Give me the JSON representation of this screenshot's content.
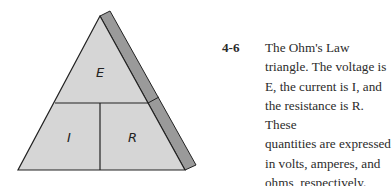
{
  "figure": {
    "type": "ohms-law-triangle",
    "labels": {
      "top": "E",
      "bottom_left": "I",
      "bottom_right": "R"
    },
    "colors": {
      "face": "#d6d6d6",
      "side": "#9a9a9a",
      "stroke": "#222222"
    }
  },
  "caption": {
    "number": "4-6",
    "lines": [
      "The Ohm's Law",
      "triangle. The voltage is",
      "E, the current is I, and",
      "the resistance is R. These",
      "quantities are expressed",
      "in volts, amperes, and",
      "ohms, respectively."
    ],
    "text": "The Ohm's Law triangle. The voltage is E, the current is I, and the resistance is R. These quantities are expressed in volts, amperes, and ohms, respectively."
  }
}
